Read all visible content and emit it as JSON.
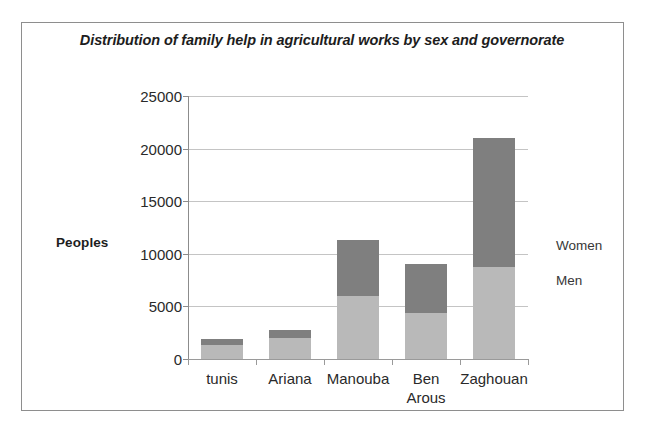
{
  "chart_data": {
    "type": "bar",
    "subtype": "stacked-vertical",
    "title": "Distribution of family help in agricultural  works by sex and governorate",
    "xlabel": "",
    "ylabel": "Peoples",
    "ylim": [
      0,
      25000
    ],
    "ytick_values": [
      25000,
      20000,
      15000,
      10000,
      5000,
      0
    ],
    "ytick_labels": [
      "25000",
      "20000",
      "15000",
      "10000",
      "5000",
      "0"
    ],
    "grid": true,
    "legend_position": "right",
    "categories": [
      "tunis",
      "Ariana",
      "Manouba",
      "Ben Arous",
      "Zaghouan"
    ],
    "category_label_lines": [
      [
        "tunis"
      ],
      [
        "Ariana"
      ],
      [
        "Manouba"
      ],
      [
        "Ben",
        "Arous"
      ],
      [
        "Zaghouan"
      ]
    ],
    "series": [
      {
        "name": "Men",
        "color": "#b9b9b9",
        "values": [
          1300,
          2000,
          6000,
          4400,
          8700
        ]
      },
      {
        "name": "Women",
        "color": "#7f7f7f",
        "values": [
          600,
          800,
          5300,
          4600,
          12300
        ]
      }
    ],
    "totals": [
      1900,
      2800,
      11300,
      9000,
      21000
    ],
    "legend": [
      {
        "label": "Women",
        "color": "#7f7f7f"
      },
      {
        "label": "Men",
        "color": "#b9b9b9"
      }
    ]
  },
  "frame": {
    "border_color": "#8e8e8e",
    "background": "#ffffff"
  }
}
